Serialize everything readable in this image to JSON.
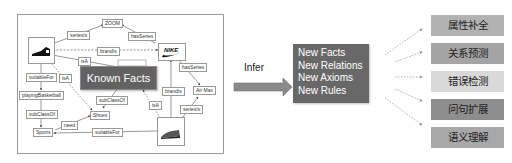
{
  "knowledge_graph": {
    "center_label": "Known Facts",
    "nodes": {
      "zoom": "ZOOM",
      "nike_logo": "Nike logo",
      "air_max": "Air Max",
      "playing_basketball": "playingBasketball",
      "shoes": "Shoes",
      "sports": "Sports"
    },
    "edge_labels": {
      "series1": "seriesIs",
      "has_series1": "hasSeries",
      "brand_is": "brandIs",
      "is_a1": "isA",
      "suitable_for1": "suitableFor",
      "is_a2": "isA",
      "has_series2": "hasSeries",
      "sub_class_of1": "subClassOf",
      "brand_is2": "brandIs",
      "is_a3": "isA",
      "series2": "seriesIs",
      "sub_class_of2": "subClassOf",
      "need": "need",
      "suitable_for2": "suitableFor"
    }
  },
  "infer": {
    "label": "Infer"
  },
  "outputs": {
    "items": [
      "New Facts",
      "New Relations",
      "New Axioms",
      "New Rules"
    ]
  },
  "tasks": [
    {
      "label": "属性补全",
      "color": "#b2b2b2"
    },
    {
      "label": "关系预测",
      "color": "#a4a4a4"
    },
    {
      "label": "错误检测",
      "color": "#d9d9d9"
    },
    {
      "label": "问句扩展",
      "color": "#8e8e8e"
    },
    {
      "label": "语义理解",
      "color": "#a8a8a8"
    }
  ],
  "colors": {
    "dark_box": "#666666",
    "arrow_fill": "#8a8a8a",
    "frame": "#9a9a9a"
  }
}
